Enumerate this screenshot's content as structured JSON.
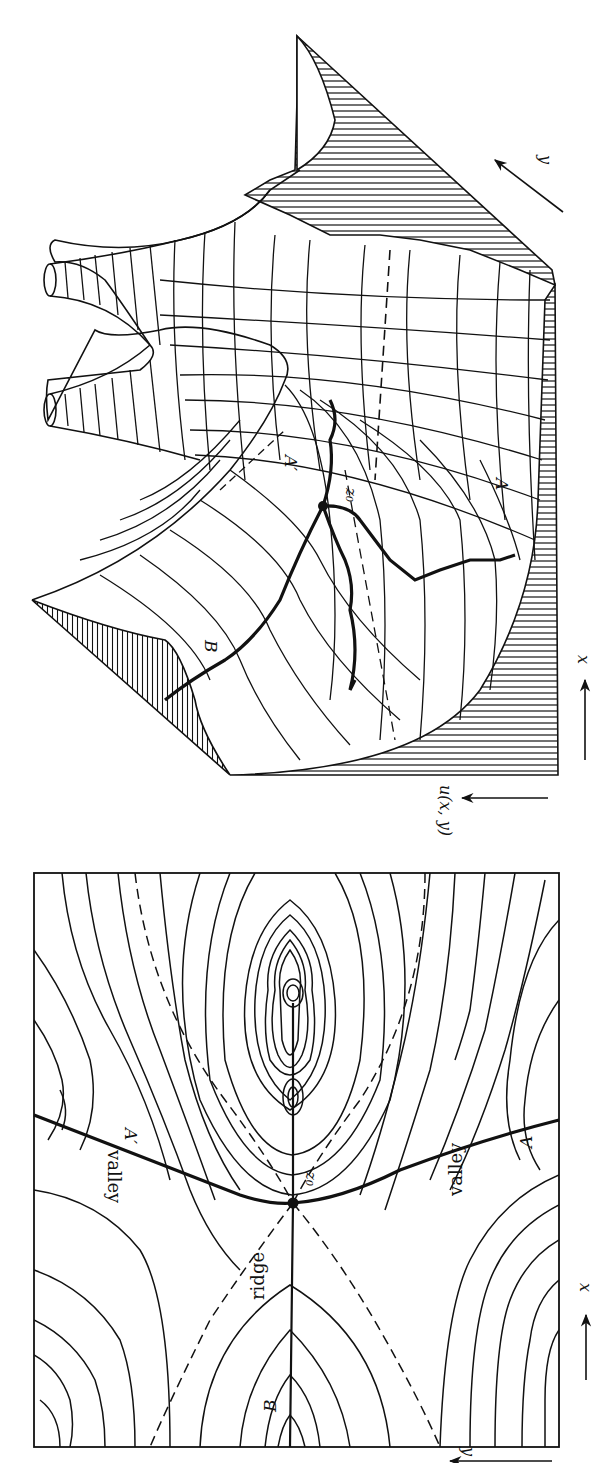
{
  "figure": {
    "orientation": "rotated 90deg clockwise",
    "panels": [
      {
        "id": "surface",
        "description": "3D surface of u(x,y) near saddle point",
        "labels": {
          "saddle": "z₀",
          "path_a": "A",
          "path_a_prime": "A′",
          "path_b": "B",
          "axis_u": "u(x, y)",
          "axis_x": "x",
          "axis_y": "y"
        }
      },
      {
        "id": "contour",
        "description": "Contour map of u(x,y) with saddle point z₀",
        "labels": {
          "saddle": "z₀",
          "path_a": "A",
          "path_a_prime": "A′",
          "path_b": "B",
          "ridge": "ridge",
          "valley_upper": "valley",
          "valley_lower": "valley",
          "axis_x": "x",
          "axis_y": "y"
        }
      }
    ]
  },
  "colors": {
    "ink": "#111111",
    "paper": "#ffffff"
  }
}
